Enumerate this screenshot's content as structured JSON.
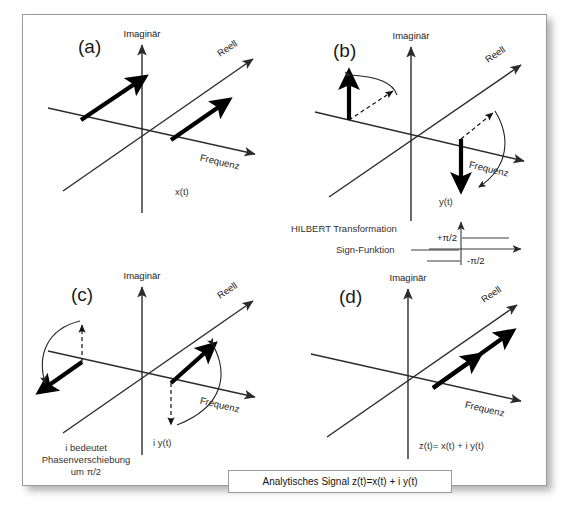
{
  "figure": {
    "caption_box": "Analytisches Signal z(t)=x(t) + i y(t)",
    "axes": {
      "imaginary": "Imaginär",
      "real": "Reell",
      "frequency": "Frequenz"
    },
    "panels": [
      {
        "id": "a",
        "label": "(a)",
        "signal_label": "x(t)",
        "description": "Two thick vectors parallel to the real axis, one in the negative frequency half and one in the positive frequency half, both pointing up-right along Reell."
      },
      {
        "id": "b",
        "label": "(b)",
        "signal_label": "y(t)",
        "description": "Hilbert transformed signal: left component rotated +90 degrees to point up along the imaginary direction, right component rotated -90 degrees to point down; dashed original vectors and curved rotation arcs shown.",
        "annotations": [
          "HILBERT Transformation",
          "Sign-Funktion"
        ],
        "sign_function": {
          "upper_value": "+π/2",
          "lower_value": "-π/2"
        }
      },
      {
        "id": "c",
        "label": "(c)",
        "signal_label": "i y(t)",
        "description": "Multiplication by i: another 90 degree phase shift; left vector now points down-left, right vector points up-right; dashed previous vectors and curved arcs shown.",
        "note_lines": [
          "i bedeutet",
          "Phasenverschiebung",
          "um π/2"
        ]
      },
      {
        "id": "d",
        "label": "(d)",
        "signal_label": "z(t)= x(t) + i y(t)",
        "description": "Analytic signal: a single doubled thick vector remains in the positive frequency half along the real axis direction; negative frequency component has cancelled."
      }
    ]
  }
}
